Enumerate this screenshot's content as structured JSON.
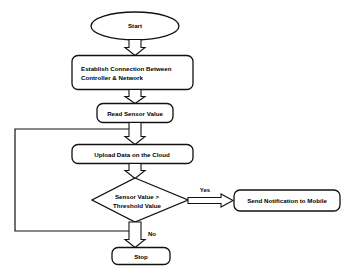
{
  "diagram": {
    "background_color": "#ffffff",
    "line_color": "#111111",
    "text_color": "#000000",
    "nodes": {
      "start": {
        "label": "Start",
        "shape": "ellipse"
      },
      "establish": {
        "line1": "Establish Connection Between",
        "line2": "Controller & Network",
        "shape": "rounded-rectangle"
      },
      "read_sensor": {
        "label": "Read Sensor Value",
        "shape": "rounded-rectangle"
      },
      "upload": {
        "label": "Upload Data on the Cloud",
        "shape": "rounded-rectangle"
      },
      "decision": {
        "line1": "Sensor Value >",
        "line2": "Threshold Value",
        "shape": "diamond"
      },
      "notify": {
        "label": "Send Notification to Mobile",
        "shape": "rounded-rectangle"
      },
      "stop": {
        "label": "Stop",
        "shape": "rounded-rectangle"
      }
    },
    "edge_labels": {
      "yes": "Yes",
      "no": "No"
    }
  }
}
